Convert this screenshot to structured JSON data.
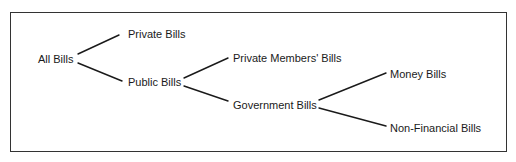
{
  "diagram": {
    "type": "tree",
    "orientation": "left-to-right",
    "nodes": [
      {
        "id": "all",
        "label": "All Bills",
        "x": 38,
        "y": 59
      },
      {
        "id": "private",
        "label": "Private Bills",
        "x": 128,
        "y": 34
      },
      {
        "id": "public",
        "label": "Public Bills",
        "x": 128,
        "y": 82
      },
      {
        "id": "pmb",
        "label": "Private Members' Bills",
        "x": 233,
        "y": 58
      },
      {
        "id": "gov",
        "label": "Government Bills",
        "x": 233,
        "y": 105
      },
      {
        "id": "money",
        "label": "Money Bills",
        "x": 390,
        "y": 74
      },
      {
        "id": "nonfin",
        "label": "Non-Financial Bills",
        "x": 390,
        "y": 128
      }
    ],
    "edges": [
      {
        "from": "all",
        "to": "private",
        "x1": 78,
        "y1": 54,
        "x2": 119,
        "y2": 35
      },
      {
        "from": "all",
        "to": "public",
        "x1": 78,
        "y1": 63,
        "x2": 122,
        "y2": 81
      },
      {
        "from": "public",
        "to": "pmb",
        "x1": 184,
        "y1": 78,
        "x2": 228,
        "y2": 58
      },
      {
        "from": "public",
        "to": "gov",
        "x1": 184,
        "y1": 86,
        "x2": 228,
        "y2": 101
      },
      {
        "from": "gov",
        "to": "money",
        "x1": 319,
        "y1": 100,
        "x2": 386,
        "y2": 73
      },
      {
        "from": "gov",
        "to": "nonfin",
        "x1": 319,
        "y1": 108,
        "x2": 386,
        "y2": 126
      }
    ]
  }
}
